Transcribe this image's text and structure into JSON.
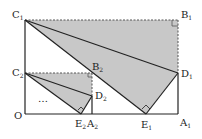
{
  "diagram": {
    "colors": {
      "fill": "#c8c8c8",
      "stroke": "#222222",
      "dashed": "#555555"
    },
    "points": {
      "O": {
        "label": "O",
        "sub": "",
        "x": 25,
        "y": 114
      },
      "C1": {
        "label": "C",
        "sub": "1",
        "x": 25,
        "y": 20
      },
      "B1": {
        "label": "B",
        "sub": "1",
        "x": 178,
        "y": 20
      },
      "A1": {
        "label": "A",
        "sub": "1",
        "x": 178,
        "y": 114
      },
      "D1": {
        "label": "D",
        "sub": "1",
        "x": 178,
        "y": 73
      },
      "E1": {
        "label": "E",
        "sub": "1",
        "x": 146,
        "y": 114
      },
      "C2": {
        "label": "C",
        "sub": "2",
        "x": 25,
        "y": 73
      },
      "B2": {
        "label": "B",
        "sub": "2",
        "x": 92,
        "y": 73
      },
      "A2": {
        "label": "A",
        "sub": "2",
        "x": 92,
        "y": 114
      },
      "D2": {
        "label": "D",
        "sub": "2",
        "x": 92,
        "y": 96
      },
      "E2": {
        "label": "E",
        "sub": "2",
        "x": 81,
        "y": 114
      }
    },
    "ellipsis": "…"
  }
}
